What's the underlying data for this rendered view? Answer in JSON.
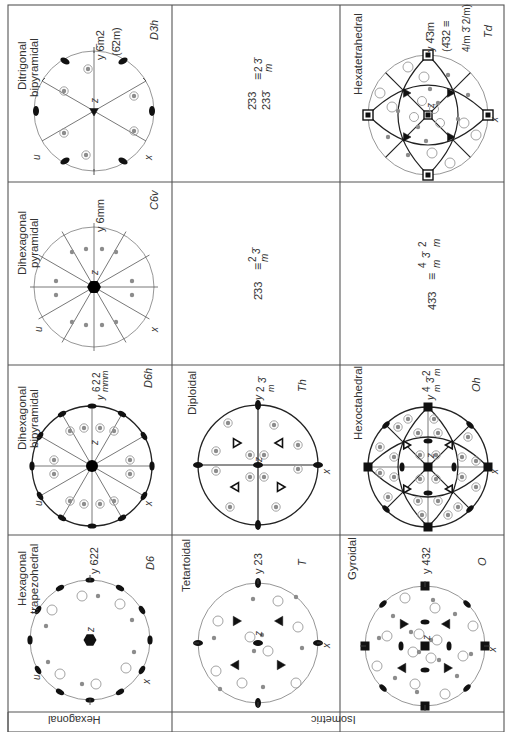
{
  "table": {
    "title": "Crystal classes — stereograms (rotated page)",
    "row_labels": [
      {
        "id": "hexagonal",
        "label": "Hexagonal"
      },
      {
        "id": "isometric",
        "label": "Isometric"
      }
    ],
    "cells": [
      {
        "id": "ditrigonal-bipyramidal",
        "name_line1": "Ditrigonal",
        "name_line2": "bipyramidal",
        "symbol": "y 6̄m2",
        "symbol_alt": "(6̄2m)",
        "schoenflies": "D3h",
        "axes": [
          "u",
          "z",
          "x"
        ]
      },
      {
        "id": "dihexagonal-pyramidal",
        "name_line1": "Dihexagonal",
        "name_line2": "pyramidal",
        "symbol": "y 6mm",
        "schoenflies": "C6v",
        "axes": [
          "u",
          "z",
          "x"
        ]
      },
      {
        "id": "dihexagonal-bipyramidal",
        "name_line1": "Dihexagonal",
        "name_line2": "bipyramidal",
        "symbol": "y 6/m 2/m 2/m",
        "schoenflies": "D6h",
        "axes": [
          "u",
          "z",
          "x"
        ]
      },
      {
        "id": "hexagonal-trapezohedral",
        "name_line1": "Hexagonal",
        "name_line2": "trapezohedral",
        "symbol": "y 622",
        "schoenflies": "D6",
        "axes": [
          "u",
          "z",
          "x"
        ]
      },
      {
        "id": "iso-eq-1",
        "equation": "2̄33 ≡ 2/m 3̄",
        "equation_line2": "233̄"
      },
      {
        "id": "iso-eq-2",
        "equation": "2̄33 ≡ 2/m 3̄"
      },
      {
        "id": "diploidal",
        "name_line1": "Diploidal",
        "symbol": "y 2/m 3̄",
        "schoenflies": "Th",
        "axes": [
          "z",
          "x"
        ]
      },
      {
        "id": "tetartoidal",
        "name_line1": "Tetartoidal",
        "symbol": "y 23",
        "schoenflies": "T",
        "axes": [
          "z",
          "x"
        ]
      },
      {
        "id": "hexatetrahedral",
        "name_line1": "Hexatetrahedral",
        "symbol": "y 4̄3m",
        "symbol_alt": "(4̄32 ≡",
        "symbol_alt2": "4/m 3̄ 2/m)",
        "schoenflies": "Td",
        "axes": [
          "z",
          "x"
        ]
      },
      {
        "id": "iso-eq-3",
        "equation": "43̄3 ≡ 4/m 3̄ 2/m"
      },
      {
        "id": "hexoctahedral",
        "name_line1": "Hexoctahedral",
        "symbol": "y 4/m 3̄ 2/m",
        "schoenflies": "Oh",
        "axes": [
          "z",
          "x"
        ]
      },
      {
        "id": "gyroidal",
        "name_line1": "Gyroidal",
        "symbol": "y 432",
        "schoenflies": "O",
        "axes": [
          "z",
          "x"
        ]
      }
    ]
  },
  "colors": {
    "line": "#333333",
    "grid": "#555555",
    "circle": "#8a8a8a",
    "dot": "#8c8c8c",
    "fill": "#111111"
  }
}
